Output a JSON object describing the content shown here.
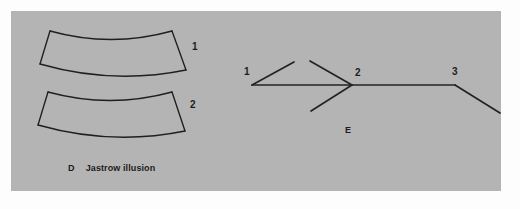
{
  "figure": {
    "background_color": "#b4b4b4",
    "page_color": "#fdfdfd",
    "ink_color": "#1f1f1f",
    "panels": [
      {
        "letter": "D",
        "title": "Jastrow illusion",
        "caption_letter": "D",
        "caption_text": "Jastrow illusion",
        "shape_labels": [
          "1",
          "2"
        ],
        "description": "Two identical curved arc-segment (trapezoidal) figures stacked vertically; the lower one appears larger."
      },
      {
        "letter": "E",
        "title": "",
        "caption_letter": "E",
        "caption_text": "",
        "vertex_labels": [
          "1",
          "2",
          "3"
        ],
        "description": "Muller-Lyer style line figure: a horizontal shaft with outward fins at vertex 1, inward arrowhead fins at vertex 2, and a single fin at vertex 3."
      }
    ],
    "jastrow": {
      "shape1": {
        "label": "1",
        "label_x": 192,
        "label_y": 42,
        "top_path": "M 50 31 Q 111 48 172 31",
        "bottom_path": "M 40 64 Q 113 85 186 70",
        "left_path": "M 50 31 L 40 64",
        "right_path": "M 172 31 L 186 70"
      },
      "shape2": {
        "label": "2",
        "label_x": 190,
        "label_y": 100,
        "top_path": "M 48 92 Q 110 109 172 92",
        "bottom_path": "M 38 125 Q 112 146 185 131",
        "left_path": "M 48 92 L 38 125",
        "right_path": "M 172 92 L 185 131"
      },
      "caption_x": 68,
      "caption_y": 164
    },
    "muller_lyer": {
      "shaft": "M 252 85 L 455 85",
      "vertex1": {
        "label": "1",
        "x": 252,
        "y": 85,
        "label_x": 244,
        "label_y": 67
      },
      "vertex2": {
        "label": "2",
        "x": 352,
        "y": 85,
        "label_x": 355,
        "label_y": 68
      },
      "vertex3": {
        "label": "3",
        "x": 455,
        "y": 85,
        "label_x": 452,
        "label_y": 67
      },
      "fin1_upper": "M 252 85 L 294 62",
      "fin2_upper": "M 352 85 L 310 61",
      "fin2_lower": "M 352 85 L 311 111",
      "fin3_lower": "M 455 85 L 500 113",
      "caption_letter": "E",
      "caption_x": 345,
      "caption_y": 126
    }
  }
}
